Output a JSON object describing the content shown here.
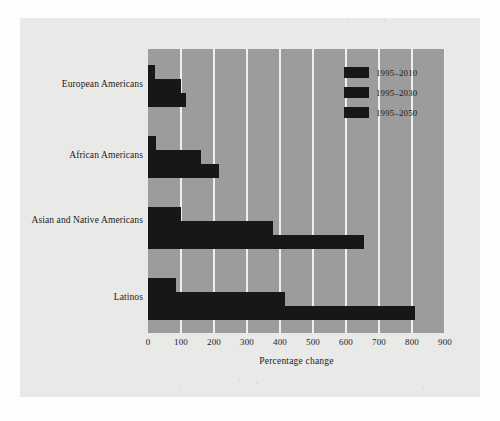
{
  "chart_data": {
    "type": "bar",
    "orientation": "horizontal",
    "title": "",
    "xlabel": "Percentage change",
    "ylabel": "",
    "categories": [
      "European Americans",
      "African Americans",
      "Asian and Native Americans",
      "Latinos"
    ],
    "series": [
      {
        "name": "1995–2010",
        "values": [
          20,
          25,
          100,
          85
        ]
      },
      {
        "name": "1995–2030",
        "values": [
          100,
          160,
          380,
          415
        ]
      },
      {
        "name": "1995–2050",
        "values": [
          115,
          215,
          655,
          810
        ]
      }
    ],
    "xlim": [
      0,
      900
    ],
    "xticks": [
      0,
      100,
      200,
      300,
      400,
      500,
      600,
      700,
      800,
      900
    ],
    "xtick_labels": [
      "0",
      "100",
      "200",
      "300",
      "400",
      "500",
      "600",
      "700",
      "800",
      "900"
    ],
    "grid": "vertical",
    "legend_position": "top-right-inside",
    "colors": {
      "bar": "#171717",
      "plot_background": "#9c9c9c",
      "gridline": "#efefed",
      "page_background": "#e9e9e7",
      "text": "#1c1c1c"
    }
  }
}
